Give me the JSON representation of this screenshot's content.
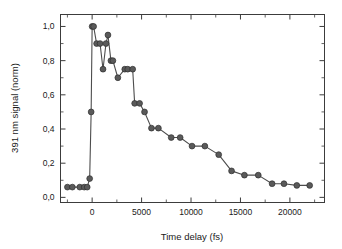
{
  "chart_data": {
    "type": "line",
    "title": "",
    "xlabel": "Time delay (fs)",
    "ylabel": "391 nm signal (norm)",
    "xlim": [
      -3200,
      23500
    ],
    "ylim": [
      -0.03,
      1.07
    ],
    "grid": false,
    "legend": null,
    "decimal_separator": ",",
    "xticks": [
      0,
      5000,
      10000,
      15000,
      20000
    ],
    "xtick_labels": [
      "0",
      "5000",
      "10000",
      "15000",
      "20000"
    ],
    "yticks": [
      0.0,
      0.2,
      0.4,
      0.6,
      0.8,
      1.0
    ],
    "ytick_labels": [
      "0,0",
      "0,2",
      "0,4",
      "0,6",
      "0,8",
      "1,0"
    ],
    "x_minor_ticks": [
      -2500,
      2500,
      7500,
      12500,
      17500,
      22500
    ],
    "y_minor_ticks": [
      0.1,
      0.3,
      0.5,
      0.7,
      0.9
    ],
    "marker": "filled-circle",
    "marker_color": "#5a5a5a",
    "line_color": "#4d4d4d",
    "series": [
      {
        "name": "391 nm signal",
        "x": [
          -2500,
          -2000,
          -1250,
          -800,
          -500,
          -250,
          -100,
          0,
          150,
          450,
          800,
          1100,
          1400,
          1600,
          1900,
          2100,
          2600,
          3300,
          3600,
          4100,
          4300,
          4800,
          5300,
          6000,
          6700,
          8000,
          8900,
          10100,
          11400,
          12800,
          14100,
          15400,
          16800,
          18200,
          19400,
          20700,
          22000
        ],
        "y": [
          0.06,
          0.06,
          0.06,
          0.06,
          0.06,
          0.11,
          0.5,
          1.0,
          1.0,
          0.9,
          0.9,
          0.75,
          0.9,
          0.95,
          0.8,
          0.8,
          0.7,
          0.75,
          0.75,
          0.75,
          0.55,
          0.55,
          0.5,
          0.405,
          0.405,
          0.35,
          0.35,
          0.3,
          0.3,
          0.25,
          0.155,
          0.13,
          0.13,
          0.08,
          0.08,
          0.07,
          0.07
        ]
      }
    ]
  }
}
